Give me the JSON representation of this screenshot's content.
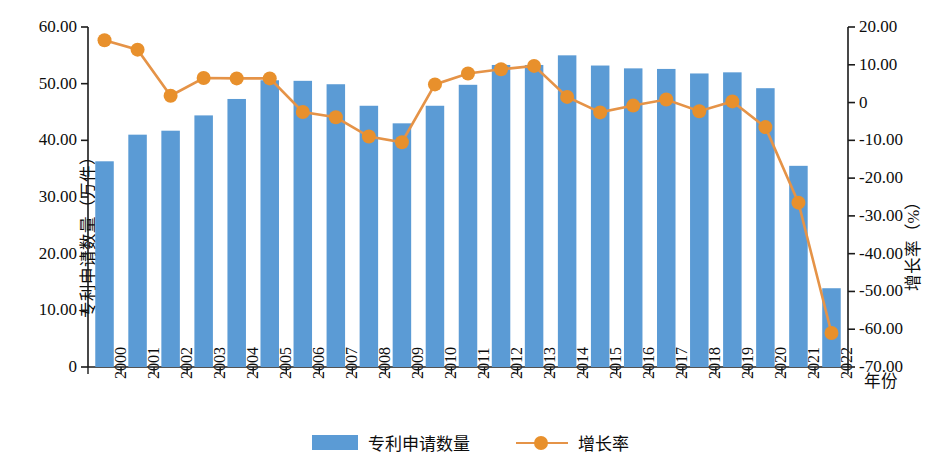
{
  "chart_data": {
    "type": "bar",
    "title": "",
    "xlabel": "年份",
    "ylabel": "专利申请数量（万件）",
    "y2label": "增长率（%）",
    "categories": [
      "2000",
      "2001",
      "2002",
      "2003",
      "2004",
      "2005",
      "2006",
      "2007",
      "2008",
      "2009",
      "2010",
      "2011",
      "2012",
      "2013",
      "2014",
      "2015",
      "2016",
      "2017",
      "2018",
      "2019",
      "2020",
      "2021",
      "2022"
    ],
    "series": [
      {
        "name": "专利申请数量",
        "type": "bar",
        "axis": "left",
        "unit": "万件",
        "color": "#5b9bd5",
        "values": [
          36.3,
          41.0,
          41.7,
          44.4,
          47.3,
          50.6,
          50.5,
          49.9,
          46.1,
          43.0,
          46.1,
          49.8,
          53.3,
          53.3,
          55.0,
          53.2,
          52.7,
          52.6,
          51.8,
          52.0,
          49.2,
          35.5,
          13.9
        ]
      },
      {
        "name": "增长率",
        "type": "line",
        "axis": "right",
        "unit": "%",
        "color": "#e8902c",
        "line_color": "#e59347",
        "values": [
          16.5,
          14.0,
          1.8,
          6.5,
          6.4,
          6.4,
          -2.5,
          -3.9,
          -9.0,
          -10.5,
          4.8,
          7.7,
          8.8,
          9.7,
          1.5,
          -2.6,
          -0.8,
          0.8,
          -2.3,
          0.3,
          -6.5,
          -26.5,
          -61.0
        ]
      }
    ],
    "axes": {
      "left": {
        "label": "专利申请数量（万件）",
        "min": 0,
        "max": 60,
        "step": 10,
        "ticks": [
          "0",
          "10.00",
          "20.00",
          "30.00",
          "40.00",
          "50.00",
          "60.00"
        ]
      },
      "right": {
        "label": "增长率（%）",
        "min": -70,
        "max": 20,
        "step": 10,
        "ticks": [
          "-70.00",
          "-60.00",
          "-50.00",
          "-40.00",
          "-30.00",
          "-20.00",
          "-10.00",
          "0",
          "10.00",
          "20.00"
        ]
      },
      "x": {
        "label": "年份",
        "grid": false
      }
    },
    "legend": {
      "position": "bottom",
      "entries": [
        {
          "label": "专利申请数量",
          "marker": "bar",
          "color": "#5b9bd5"
        },
        {
          "label": "增长率",
          "marker": "line-circle",
          "color": "#e8902c"
        }
      ]
    }
  }
}
